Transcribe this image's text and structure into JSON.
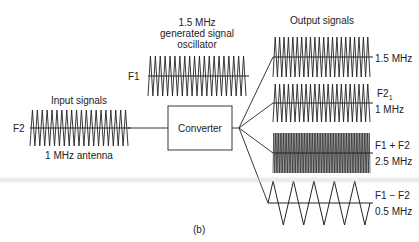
{
  "figure": {
    "caption": "(b)",
    "converter": {
      "label": "Converter"
    },
    "input": {
      "title": "Input signals",
      "name": "F2",
      "description": "1 MHz antenna",
      "frequency_mhz": 1.0,
      "cycles": 20
    },
    "oscillator": {
      "title_line1": "1.5 MHz",
      "title_line2": "generated signal",
      "title_line3": "oscillator",
      "name": "F1",
      "frequency_mhz": 1.5,
      "cycles": 20
    },
    "outputs": {
      "title": "Output signals",
      "items": [
        {
          "name": "",
          "freq_label": "1.5 MHz",
          "frequency_mhz": 1.5,
          "cycles": 22,
          "shape": "sawtooth"
        },
        {
          "name": "F2",
          "name_sub": "1",
          "freq_label": "1 MHz",
          "frequency_mhz": 1.0,
          "cycles": 22,
          "shape": "sawtooth"
        },
        {
          "name": "F1 + F2",
          "freq_label": "2.5 MHz",
          "frequency_mhz": 2.5,
          "cycles": 60,
          "shape": "dense"
        },
        {
          "name": "F1 − F2",
          "freq_label": "0.5 MHz",
          "frequency_mhz": 0.5,
          "cycles": 5,
          "shape": "triangle"
        }
      ]
    },
    "colors": {
      "ink": "#222222",
      "background": "#ffffff"
    }
  }
}
